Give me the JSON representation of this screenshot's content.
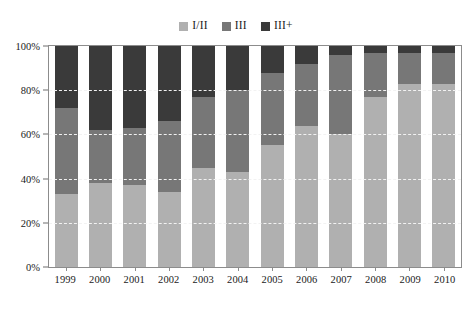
{
  "chart_data": {
    "type": "bar",
    "subtype": "stacked-percent",
    "title": "",
    "subtitle": "",
    "xlabel": "",
    "ylabel": "",
    "ylim": [
      0,
      100
    ],
    "yticks": [
      "0%",
      "20%",
      "40%",
      "60%",
      "80%",
      "100%"
    ],
    "ytick_values": [
      0,
      20,
      40,
      60,
      80,
      100
    ],
    "grid": true,
    "grid_orientation": "horizontal",
    "grid_style": "dashed",
    "legend_position": "top-center",
    "categories": [
      "1999",
      "2000",
      "2001",
      "2002",
      "2003",
      "2004",
      "2005",
      "2006",
      "2007",
      "2008",
      "2009",
      "2010"
    ],
    "series": [
      {
        "name": "I/II",
        "color": "#b0b0b0",
        "values": [
          33,
          38,
          37,
          34,
          45,
          43,
          55,
          64,
          60,
          77,
          83,
          83
        ]
      },
      {
        "name": "III",
        "color": "#777777",
        "values": [
          39,
          24,
          26,
          32,
          32,
          37,
          33,
          28,
          36,
          20,
          14,
          14
        ]
      },
      {
        "name": "III+",
        "color": "#3a3a3a",
        "values": [
          28,
          38,
          37,
          34,
          23,
          20,
          12,
          8,
          4,
          3,
          3,
          3
        ]
      }
    ]
  },
  "legend": {
    "entries": [
      {
        "label": "I/II",
        "color": "#b0b0b0",
        "swatch_name": "legend-swatch-i-ii"
      },
      {
        "label": "III",
        "color": "#777777",
        "swatch_name": "legend-swatch-iii"
      },
      {
        "label": "III+",
        "color": "#3a3a3a",
        "swatch_name": "legend-swatch-iii-plus"
      }
    ]
  },
  "axes": {
    "y": {
      "ticks": [
        "0%",
        "20%",
        "40%",
        "60%",
        "80%",
        "100%"
      ]
    },
    "x": {
      "ticks": [
        "1999",
        "2000",
        "2001",
        "2002",
        "2003",
        "2004",
        "2005",
        "2006",
        "2007",
        "2008",
        "2009",
        "2010"
      ]
    }
  },
  "colors": {
    "series_light": "#b0b0b0",
    "series_mid": "#777777",
    "series_dark": "#3a3a3a",
    "frame": "#8c8c8c",
    "gridline": "#f2f2f2",
    "text": "#1a1a1a",
    "background": "#ffffff"
  }
}
